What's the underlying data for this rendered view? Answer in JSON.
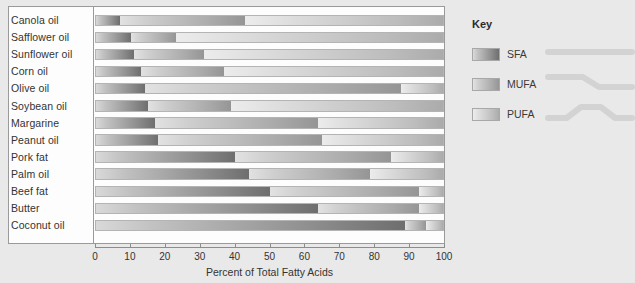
{
  "chart_data": {
    "type": "bar",
    "subtype": "stacked-horizontal-bar",
    "title": "",
    "xlabel": "Percent of Total Fatty Acids",
    "ylabel": "",
    "xlim": [
      0,
      100
    ],
    "xticks": [
      0,
      10,
      20,
      30,
      40,
      50,
      60,
      70,
      80,
      90,
      100
    ],
    "grid": false,
    "legend_position": "right",
    "categories": [
      "Canola oil",
      "Safflower oil",
      "Sunflower oil",
      "Corn oil",
      "Olive oil",
      "Soybean oil",
      "Margarine",
      "Peanut oil",
      "Pork fat",
      "Palm oil",
      "Beef fat",
      "Butter",
      "Coconut oil"
    ],
    "series": [
      {
        "name": "SFA",
        "values": [
          7,
          10,
          11,
          13,
          14,
          15,
          17,
          18,
          40,
          44,
          50,
          64,
          89
        ]
      },
      {
        "name": "MUFA",
        "values": [
          36,
          13,
          20,
          24,
          74,
          24,
          47,
          47,
          45,
          35,
          43,
          29,
          6
        ]
      },
      {
        "name": "PUFA",
        "values": [
          57,
          77,
          69,
          63,
          12,
          61,
          36,
          35,
          15,
          21,
          7,
          7,
          5
        ]
      }
    ]
  },
  "key": {
    "title": "Key",
    "items": [
      {
        "label": "SFA",
        "shape": "straight-chain-icon",
        "bends": 0
      },
      {
        "label": "MUFA",
        "shape": "one-bend-chain-icon",
        "bends": 1
      },
      {
        "label": "PUFA",
        "shape": "two-bend-chain-icon",
        "bends": 2
      }
    ]
  },
  "colors": {
    "background": "#e9e9e9",
    "panel": "#fdfdfd",
    "border": "#9a9a9a",
    "sfa": "#8e8e8e",
    "mufa": "#a9a9a9",
    "pufa": "#c8c8c8",
    "text": "#333333"
  }
}
